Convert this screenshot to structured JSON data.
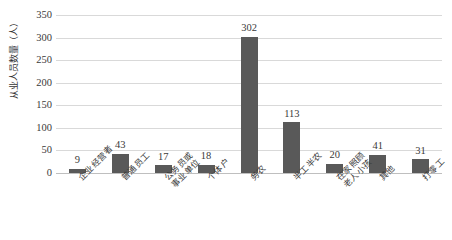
{
  "chart_data": {
    "type": "bar",
    "title": "",
    "xlabel": "",
    "ylabel": "从业人员数量（人）",
    "ylim": [
      0,
      350
    ],
    "ytick_step": 50,
    "yticks": [
      "350",
      "300",
      "250",
      "200",
      "150",
      "100",
      "50",
      "0"
    ],
    "grid": true,
    "legend": "none",
    "bar_color": "#595959",
    "gridline_color": "#d9d9d9",
    "categories": [
      "企业经营者",
      "普通员工",
      "公务员或事业单位",
      "个体户",
      "务农",
      "半工半农",
      "在家照顾老人小孩",
      "其他",
      "打零工"
    ],
    "category_lines": [
      [
        "企业经营者",
        ""
      ],
      [
        "普通员工",
        ""
      ],
      [
        "公务员或",
        "事业单位"
      ],
      [
        "个体户",
        ""
      ],
      [
        "务农",
        ""
      ],
      [
        "半工半农",
        ""
      ],
      [
        "在家照顾",
        "老人小孩"
      ],
      [
        "其他",
        ""
      ],
      [
        "打零工",
        ""
      ]
    ],
    "values": [
      9,
      43,
      17,
      18,
      302,
      113,
      20,
      41,
      31
    ],
    "value_labels": [
      "9",
      "43",
      "17",
      "18",
      "302",
      "113",
      "20",
      "41",
      "31"
    ]
  }
}
